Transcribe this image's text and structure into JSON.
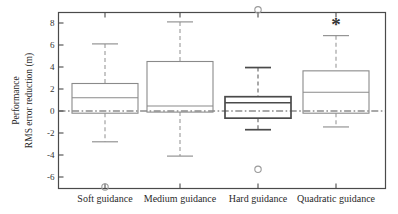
{
  "chart_data": {
    "type": "box",
    "title": "",
    "xlabel": "",
    "ylabel_line1": "Performance",
    "ylabel_line2": "RMS error reduction (m)",
    "categories": [
      "Soft guidance",
      "Medium guidance",
      "Hard guidance",
      "Quadratic guidance"
    ],
    "ylim": [
      -7.6,
      9.6
    ],
    "yticks": [
      -6,
      -4,
      -2,
      0,
      2,
      4,
      6,
      8
    ],
    "ytick_labels": [
      "-6",
      "-4",
      "-2",
      "0",
      "2",
      "4",
      "6",
      "8"
    ],
    "grid": false,
    "legend": "none",
    "zero_reference_line": 0,
    "boxes": [
      {
        "category": "Soft guidance",
        "whisker_high": 6.1,
        "q3": 2.5,
        "median": 1.2,
        "q1": -0.2,
        "whisker_low": -2.8,
        "outliers": [
          -6.9
        ],
        "emphasis": false,
        "significance_marker": ""
      },
      {
        "category": "Medium guidance",
        "whisker_high": 8.1,
        "q3": 4.5,
        "median": 0.45,
        "q1": -0.1,
        "whisker_low": -4.1,
        "outliers": [],
        "emphasis": false,
        "significance_marker": ""
      },
      {
        "category": "Hard guidance",
        "whisker_high": 3.95,
        "q3": 1.3,
        "median": 0.75,
        "q1": -0.65,
        "whisker_low": -1.7,
        "outliers": [
          9.2,
          -5.3
        ],
        "emphasis": true,
        "significance_marker": ""
      },
      {
        "category": "Quadratic guidance",
        "whisker_high": 6.85,
        "q3": 3.65,
        "median": 1.7,
        "q1": -0.2,
        "whisker_low": -1.45,
        "outliers": [],
        "emphasis": false,
        "significance_marker": "*"
      }
    ],
    "colors": {
      "box_stroke": "#8a8a8a",
      "box_stroke_emphasis": "#4a4a4a",
      "median": "#8a8a8a",
      "whisker": "#9a9a9a",
      "outlier": "#9a9a9a",
      "axis": "#4a4a4a",
      "zero_line": "#555555",
      "marker": "#333333",
      "background": "#ffffff"
    }
  }
}
